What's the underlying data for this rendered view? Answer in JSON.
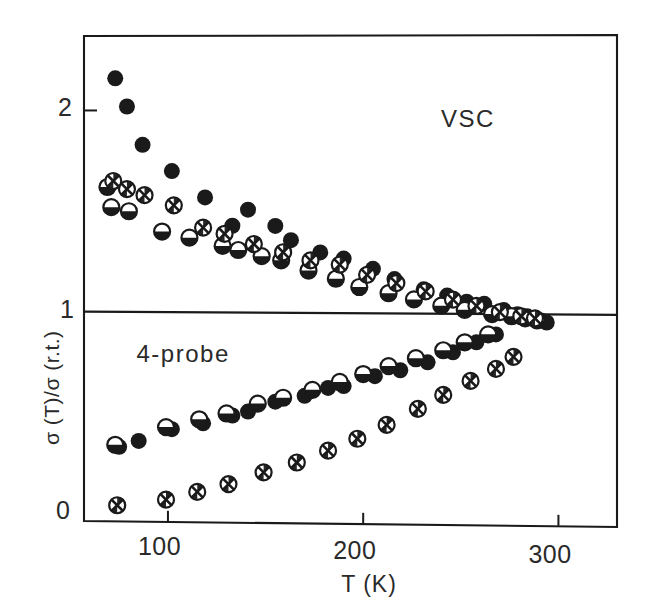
{
  "figure": {
    "background": "#ffffff",
    "ink_color": "#1a1a1a"
  },
  "annotations": {
    "upper_label": "VSC",
    "lower_label": "4-probe"
  },
  "axes": {
    "xlabel": "T (K)",
    "ylabel": "σ (T)/σ (r.t.)",
    "xticks": [
      "100",
      "200",
      "300"
    ],
    "xtick_values": [
      100,
      200,
      300
    ],
    "yticks": [
      "0",
      "1",
      "2"
    ],
    "ytick_values": [
      0,
      1,
      2
    ],
    "xlim": [
      57,
      330
    ],
    "ylim": [
      -0.04,
      2.37
    ],
    "grid": false,
    "reference_line_y": 1
  },
  "chart_data": {
    "type": "scatter",
    "title": "",
    "xlabel": "T (K)",
    "ylabel": "σ (T)/σ (r.t.)",
    "xlim": [
      57,
      330
    ],
    "ylim": [
      -0.04,
      2.37
    ],
    "grid": false,
    "legend_position": "none",
    "annotations": [
      {
        "text": "VSC",
        "x": 245,
        "y": 1.94
      },
      {
        "text": "4-probe",
        "x": 88,
        "y": 0.77
      }
    ],
    "reference_lines": [
      {
        "axis": "y",
        "value": 1
      }
    ],
    "series": [
      {
        "name": "VSC (filled circle)",
        "marker": "filled-circle",
        "branch": "upper",
        "points": [
          [
            73,
            2.16
          ],
          [
            79,
            2.02
          ],
          [
            87,
            1.83
          ],
          [
            102,
            1.7
          ],
          [
            119,
            1.57
          ],
          [
            133,
            1.43
          ],
          [
            141,
            1.51
          ],
          [
            155,
            1.43
          ],
          [
            163,
            1.36
          ],
          [
            178,
            1.3
          ],
          [
            190,
            1.27
          ],
          [
            205,
            1.22
          ],
          [
            216,
            1.17
          ],
          [
            231,
            1.12
          ],
          [
            243,
            1.09
          ],
          [
            253,
            1.06
          ],
          [
            262,
            1.05
          ],
          [
            272,
            1.02
          ],
          [
            279,
            1.0
          ],
          [
            284,
            0.99
          ],
          [
            288,
            0.98
          ],
          [
            291,
            0.97
          ],
          [
            294,
            0.96
          ]
        ]
      },
      {
        "name": "VSC (half-filled circle)",
        "marker": "half-circle",
        "branch": "upper",
        "points": [
          [
            69,
            1.62
          ],
          [
            71,
            1.52
          ],
          [
            80,
            1.5
          ],
          [
            97,
            1.4
          ],
          [
            111,
            1.37
          ],
          [
            128,
            1.33
          ],
          [
            136,
            1.31
          ],
          [
            148,
            1.28
          ],
          [
            158,
            1.26
          ],
          [
            172,
            1.21
          ],
          [
            186,
            1.17
          ],
          [
            198,
            1.13
          ],
          [
            213,
            1.1
          ],
          [
            226,
            1.07
          ],
          [
            240,
            1.04
          ],
          [
            252,
            1.02
          ],
          [
            266,
            1.0
          ],
          [
            276,
            0.99
          ],
          [
            283,
            0.98
          ],
          [
            289,
            0.97
          ]
        ]
      },
      {
        "name": "VSC (crossed circle)",
        "marker": "crossed-circle",
        "branch": "upper",
        "points": [
          [
            72,
            1.65
          ],
          [
            79,
            1.61
          ],
          [
            88,
            1.58
          ],
          [
            103,
            1.53
          ],
          [
            118,
            1.42
          ],
          [
            129,
            1.39
          ],
          [
            144,
            1.34
          ],
          [
            159,
            1.3
          ],
          [
            173,
            1.26
          ],
          [
            188,
            1.24
          ],
          [
            202,
            1.19
          ],
          [
            217,
            1.15
          ],
          [
            232,
            1.11
          ],
          [
            246,
            1.07
          ],
          [
            258,
            1.04
          ],
          [
            270,
            1.01
          ],
          [
            281,
            0.99
          ],
          [
            288,
            0.98
          ]
        ]
      },
      {
        "name": "4-probe (filled circle)",
        "marker": "filled-circle",
        "branch": "lower",
        "points": [
          [
            75,
            0.33
          ],
          [
            85,
            0.36
          ],
          [
            102,
            0.42
          ],
          [
            118,
            0.45
          ],
          [
            133,
            0.49
          ],
          [
            141,
            0.51
          ],
          [
            155,
            0.56
          ],
          [
            170,
            0.59
          ],
          [
            182,
            0.63
          ],
          [
            190,
            0.64
          ],
          [
            206,
            0.69
          ],
          [
            219,
            0.72
          ],
          [
            233,
            0.76
          ],
          [
            246,
            0.81
          ],
          [
            258,
            0.86
          ],
          [
            268,
            0.9
          ]
        ]
      },
      {
        "name": "4-probe (half-filled circle)",
        "marker": "half-circle",
        "branch": "lower",
        "points": [
          [
            73,
            0.34
          ],
          [
            99,
            0.43
          ],
          [
            116,
            0.47
          ],
          [
            130,
            0.5
          ],
          [
            146,
            0.55
          ],
          [
            159,
            0.58
          ],
          [
            174,
            0.62
          ],
          [
            188,
            0.66
          ],
          [
            200,
            0.7
          ],
          [
            213,
            0.74
          ],
          [
            227,
            0.78
          ],
          [
            241,
            0.82
          ],
          [
            252,
            0.86
          ],
          [
            264,
            0.9
          ]
        ]
      },
      {
        "name": "4-probe (crossed circle)",
        "marker": "crossed-circle",
        "branch": "lower",
        "points": [
          [
            74,
            0.04
          ],
          [
            99,
            0.07
          ],
          [
            115,
            0.11
          ],
          [
            131,
            0.15
          ],
          [
            149,
            0.21
          ],
          [
            166,
            0.26
          ],
          [
            182,
            0.32
          ],
          [
            197,
            0.38
          ],
          [
            212,
            0.45
          ],
          [
            228,
            0.53
          ],
          [
            241,
            0.6
          ],
          [
            255,
            0.67
          ],
          [
            268,
            0.73
          ],
          [
            277,
            0.79
          ]
        ]
      }
    ]
  }
}
